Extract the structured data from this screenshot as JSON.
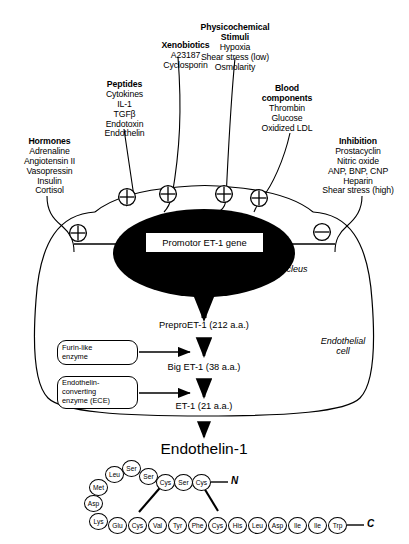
{
  "figure": {
    "title": "Endothelin-1",
    "nucleus_label": "Nucleus",
    "cell_label": "Endothelial\ncell",
    "promoter_label": "Promotor ET-1 gene"
  },
  "stimuli": [
    {
      "id": "hormones",
      "heading": "Hormones",
      "items": [
        "Adrenaline",
        "Angiotensin II",
        "Vasopressin",
        "Insulin",
        "Cortisol"
      ],
      "sign": "+"
    },
    {
      "id": "peptides",
      "heading": "Peptides",
      "items": [
        "Cytokines",
        "IL-1",
        "TGFβ",
        "Endotoxin",
        "Endothelin"
      ],
      "sign": "+"
    },
    {
      "id": "xenobiotics",
      "heading": "Xenobiotics",
      "items": [
        "A23187",
        "Cyclosporin"
      ],
      "sign": "+"
    },
    {
      "id": "physicochemical",
      "heading": "Physicochemical\nStimuli",
      "items": [
        "Hypoxia",
        "Shear stress (low)",
        "Osmolarity"
      ],
      "sign": "+"
    },
    {
      "id": "blood-components",
      "heading": "Blood\ncomponents",
      "items": [
        "Thrombin",
        "Glucose",
        "Oxidized LDL"
      ],
      "sign": "+"
    },
    {
      "id": "inhibition",
      "heading": "Inhibition",
      "items": [
        "Prostacyclin",
        "Nitric oxide",
        "ANP, BNP, CNP",
        "Heparin",
        "Shear stress (high)"
      ],
      "sign": "−"
    }
  ],
  "signs": {
    "plus": "+",
    "minus": "−"
  },
  "cascade": {
    "steps": [
      "PreproET-1 (212 a.a.)",
      "Big ET-1 (38 a.a.)",
      "ET-1 (21 a.a.)"
    ],
    "enzymes": [
      "Furin-like\nenzyme",
      "Endothelin-\nconverting\nenzyme (ECE)"
    ]
  },
  "peptide": {
    "n_terminus": "N",
    "c_terminus": "C",
    "top_residues": [
      "Lys",
      "Asp",
      "Met",
      "Leu",
      "Ser",
      "Ser",
      "Cys",
      "Ser",
      "Cys"
    ],
    "bottom_residues": [
      "Lys",
      "Glu",
      "Cys",
      "Val",
      "Tyr",
      "Phe",
      "Cys",
      "His",
      "Leu",
      "Asp",
      "Ile",
      "Ile",
      "Trp"
    ],
    "residues": [
      {
        "label": "Leu",
        "x": 105,
        "y": 466
      },
      {
        "label": "Ser",
        "x": 122,
        "y": 460
      },
      {
        "label": "Met",
        "x": 89,
        "y": 479
      },
      {
        "label": "Ser",
        "x": 139,
        "y": 468
      },
      {
        "label": "Cys",
        "x": 156,
        "y": 474
      },
      {
        "label": "Ser",
        "x": 174,
        "y": 474
      },
      {
        "label": "Cys",
        "x": 192,
        "y": 474
      },
      {
        "label": "Asp",
        "x": 84,
        "y": 495
      },
      {
        "label": "Lys",
        "x": 89,
        "y": 513
      },
      {
        "label": "Glu",
        "x": 108,
        "y": 517
      },
      {
        "label": "Cys",
        "x": 128,
        "y": 517
      },
      {
        "label": "Val",
        "x": 148,
        "y": 517
      },
      {
        "label": "Tyr",
        "x": 168,
        "y": 517
      },
      {
        "label": "Phe",
        "x": 188,
        "y": 517
      },
      {
        "label": "Cys",
        "x": 208,
        "y": 517
      },
      {
        "label": "His",
        "x": 228,
        "y": 517
      },
      {
        "label": "Leu",
        "x": 248,
        "y": 517
      },
      {
        "label": "Asp",
        "x": 268,
        "y": 517
      },
      {
        "label": "Ile",
        "x": 288,
        "y": 517
      },
      {
        "label": "Ile",
        "x": 308,
        "y": 517
      },
      {
        "label": "Trp",
        "x": 328,
        "y": 517
      }
    ]
  },
  "colors": {
    "nucleus_fill": "#000000",
    "stroke": "#000000",
    "background": "#ffffff"
  }
}
